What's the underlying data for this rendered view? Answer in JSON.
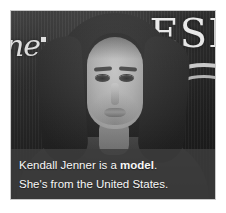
{
  "card": {
    "photo": {
      "subject_description": "Grayscale portrait photograph of a young woman with long dark hair facing the camera",
      "background_logo_left": "ne",
      "background_logo_right": "ESI",
      "background_description": "dark step-and-repeat press banner with partial wordmarks and a white curved arc"
    },
    "caption": {
      "line1_prefix": "Kendall Jenner is a ",
      "line1_bold": "model",
      "line1_suffix": ".",
      "line2": "She's from the United States."
    }
  },
  "colors": {
    "caption_background": "#3c3c3c",
    "caption_text": "#f7f7f7",
    "card_border": "#c9c9c9",
    "page_background": "#ffffff"
  }
}
